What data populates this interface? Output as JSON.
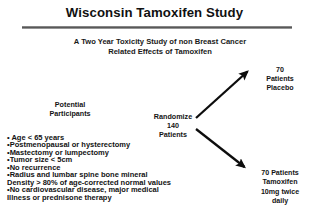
{
  "slide": {
    "title": "Wisconsin Tamoxifen Study",
    "subtitle_line1": "A Two Year Toxicity Study of non Breast Cancer",
    "subtitle_line2": "Related Effects of Tamoxifen",
    "divider_color": "#6e6e6e",
    "background_color": "#ffffff",
    "text_color": "#121212"
  },
  "flow": {
    "source": {
      "label_line1": "Potential",
      "label_line2": "Participants"
    },
    "randomize": {
      "label_line1": "Randomize",
      "label_line2": "140",
      "label_line3": "Patients"
    },
    "arms": [
      {
        "id": "placebo",
        "line1": "70",
        "line2": "Patients",
        "line3": "Placebo",
        "arrow": "up-right-arrow"
      },
      {
        "id": "tamoxifen",
        "line1": "70 Patients",
        "line2": "Tamoxifen",
        "line3": "10mg twice",
        "line4": "daily",
        "arrow": "down-right-arrow"
      }
    ]
  },
  "criteria": {
    "lines": [
      "• Age < 65 years",
      "•Postmenopausal or hysterectomy",
      "•Mastectomy or lumpectomy",
      "•Tumor size < 5cm",
      "•No recurrence",
      "•Radius and lumbar spine bone mineral",
      "Density > 80% of age-corrected normal values",
      "•No cardiovascular disease, major medical",
      "Illness or prednisone therapy"
    ]
  }
}
